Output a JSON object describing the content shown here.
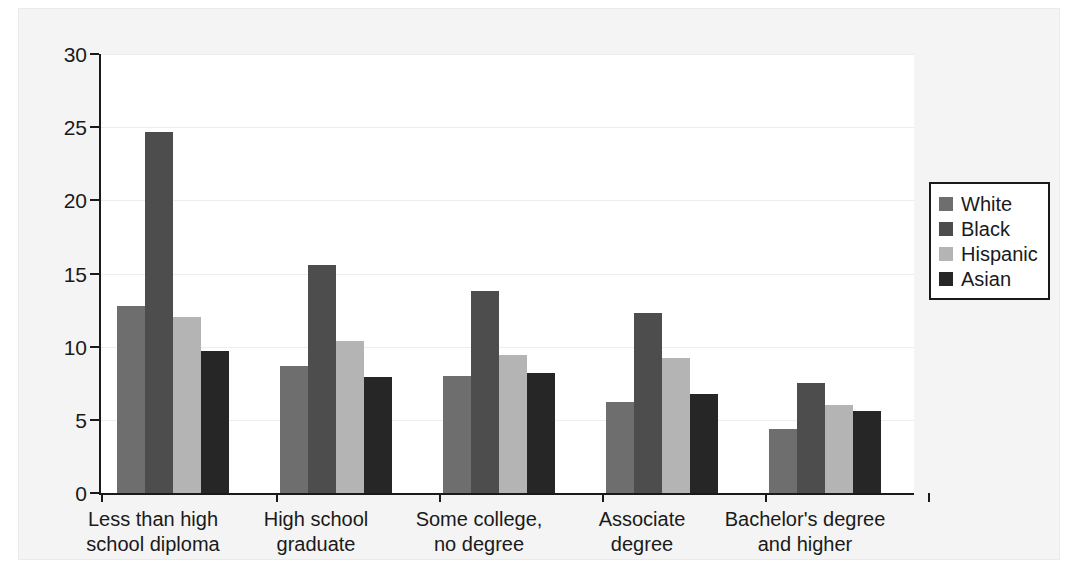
{
  "chart_data": {
    "type": "bar",
    "title": "",
    "xlabel": "",
    "ylabel": "",
    "ylim": [
      0,
      30
    ],
    "yticks": [
      0,
      5,
      10,
      15,
      20,
      25,
      30
    ],
    "ytick_labels": [
      "0",
      "5",
      "10",
      "15",
      "20",
      "25",
      "30"
    ],
    "grid": true,
    "legend_position": "right",
    "categories": [
      "Less than high\nschool diploma",
      "High school\ngraduate",
      "Some college,\nno degree",
      "Associate\ndegree",
      "Bachelor's degree\nand higher"
    ],
    "series": [
      {
        "name": "White",
        "color": "#6e6e6e",
        "values": [
          12.8,
          8.7,
          8.0,
          6.2,
          4.4
        ]
      },
      {
        "name": "Black",
        "color": "#4d4d4d",
        "values": [
          24.7,
          15.6,
          13.8,
          12.3,
          7.5
        ]
      },
      {
        "name": "Hispanic",
        "color": "#b4b4b4",
        "values": [
          12.0,
          10.4,
          9.4,
          9.2,
          6.0
        ]
      },
      {
        "name": "Asian",
        "color": "#262626",
        "values": [
          9.7,
          7.9,
          8.2,
          6.8,
          5.6
        ]
      }
    ]
  },
  "legend": {
    "items": [
      {
        "label": "White",
        "color": "#6e6e6e"
      },
      {
        "label": "Black",
        "color": "#4d4d4d"
      },
      {
        "label": "Hispanic",
        "color": "#b4b4b4"
      },
      {
        "label": "Asian",
        "color": "#262626"
      }
    ]
  },
  "colors": {
    "axis": "#1a1a1a",
    "grid": "#ededed",
    "plot_background": "#ffffff",
    "page_background": "#f4f4f4"
  }
}
